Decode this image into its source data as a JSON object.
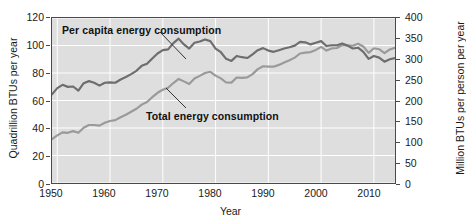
{
  "chart_data": {
    "type": "line",
    "title": "",
    "xlabel": "Year",
    "ylabel": "Quadrillion BTUs per year",
    "ylabel_right": "Million BTUs per person per year",
    "xlim": [
      1949,
      2014
    ],
    "ylim": [
      0,
      120
    ],
    "ylim_right": [
      0,
      400
    ],
    "grid": true,
    "grid_color": "#ffffff",
    "plot_background": "#dedede",
    "legend": "annotations-inline",
    "xticks": [
      "1950",
      "1960",
      "1970",
      "1980",
      "1990",
      "2000",
      "2010"
    ],
    "xtick_values": [
      1950,
      1960,
      1970,
      1980,
      1990,
      2000,
      2010
    ],
    "yticks_left": [
      "0",
      "20",
      "40",
      "60",
      "80",
      "100",
      "120"
    ],
    "ytick_values_left": [
      0,
      20,
      40,
      60,
      80,
      100,
      120
    ],
    "yticks_right": [
      "0",
      "50",
      "100",
      "150",
      "200",
      "250",
      "300",
      "350",
      "400"
    ],
    "ytick_values_right": [
      0,
      50,
      100,
      150,
      200,
      250,
      300,
      350,
      400
    ],
    "annotations": [
      {
        "label": "Per capita energy consumption",
        "x_px": 62,
        "y_px": 24,
        "leader": [
          160,
          32,
          186,
          59
        ]
      },
      {
        "label": "Total energy consumption",
        "x_px": 146,
        "y_px": 110,
        "leader": [
          186,
          108,
          166,
          88
        ]
      }
    ],
    "series": [
      {
        "name": "Per capita energy consumption",
        "axis": "right",
        "color": "#6e6e6e",
        "linewidth": 2.2,
        "unit": "Million BTUs per person per year",
        "x": [
          1949,
          1950,
          1951,
          1952,
          1953,
          1954,
          1955,
          1956,
          1957,
          1958,
          1959,
          1960,
          1961,
          1962,
          1963,
          1964,
          1965,
          1966,
          1967,
          1968,
          1969,
          1970,
          1971,
          1972,
          1973,
          1974,
          1975,
          1976,
          1977,
          1978,
          1979,
          1980,
          1981,
          1982,
          1983,
          1984,
          1985,
          1986,
          1987,
          1988,
          1989,
          1990,
          1991,
          1992,
          1993,
          1994,
          1995,
          1996,
          1997,
          1998,
          1999,
          2000,
          2001,
          2002,
          2003,
          2004,
          2005,
          2006,
          2007,
          2008,
          2009,
          2010,
          2011,
          2012,
          2013,
          2014
        ],
        "values": [
          215,
          230,
          238,
          233,
          234,
          224,
          242,
          247,
          243,
          236,
          243,
          244,
          243,
          251,
          257,
          264,
          272,
          284,
          289,
          302,
          314,
          322,
          324,
          339,
          350,
          336,
          326,
          340,
          343,
          348,
          344,
          326,
          317,
          301,
          296,
          308,
          305,
          303,
          312,
          322,
          327,
          321,
          318,
          322,
          326,
          329,
          333,
          342,
          341,
          336,
          340,
          344,
          332,
          334,
          334,
          338,
          333,
          326,
          328,
          318,
          301,
          308,
          304,
          294,
          300,
          303
        ]
      },
      {
        "name": "Total energy consumption",
        "axis": "left",
        "color": "#9a9a9a",
        "linewidth": 2.2,
        "unit": "Quadrillion BTUs per year",
        "x": [
          1949,
          1950,
          1951,
          1952,
          1953,
          1954,
          1955,
          1956,
          1957,
          1958,
          1959,
          1960,
          1961,
          1962,
          1963,
          1964,
          1965,
          1966,
          1967,
          1968,
          1969,
          1970,
          1971,
          1972,
          1973,
          1974,
          1975,
          1976,
          1977,
          1978,
          1979,
          1980,
          1981,
          1982,
          1983,
          1984,
          1985,
          1986,
          1987,
          1988,
          1989,
          1990,
          1991,
          1992,
          1993,
          1994,
          1995,
          1996,
          1997,
          1998,
          1999,
          2000,
          2001,
          2002,
          2003,
          2004,
          2005,
          2006,
          2007,
          2008,
          2009,
          2010,
          2011,
          2012,
          2013,
          2014
        ],
        "values": [
          32.0,
          34.6,
          36.8,
          36.5,
          37.7,
          36.6,
          40.2,
          42.2,
          42.2,
          41.7,
          43.8,
          45.1,
          45.7,
          47.8,
          49.6,
          51.8,
          54.0,
          57.0,
          58.9,
          62.4,
          65.6,
          67.8,
          69.3,
          72.7,
          75.7,
          73.9,
          72.0,
          76.0,
          77.9,
          80.0,
          80.9,
          78.1,
          76.1,
          73.1,
          73.0,
          76.7,
          76.5,
          76.8,
          79.2,
          82.8,
          84.9,
          84.7,
          84.6,
          85.9,
          87.6,
          89.3,
          91.2,
          94.2,
          94.8,
          95.2,
          96.8,
          99.0,
          96.3,
          97.9,
          98.2,
          100.4,
          100.2,
          99.8,
          101.3,
          99.3,
          94.6,
          98.0,
          97.3,
          94.5,
          97.1,
          98.3
        ]
      }
    ]
  },
  "axes": {
    "left_title": "Quadrillion BTUs per year",
    "right_title": "Million BTUs per person per year",
    "bottom_title": "Year"
  }
}
